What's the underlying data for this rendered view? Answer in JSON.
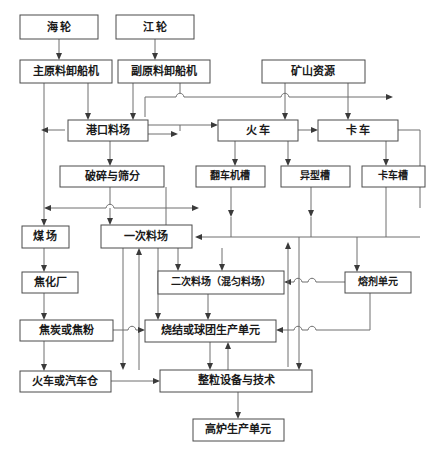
{
  "diagram": {
    "type": "flowchart",
    "canvas": {
      "width": 443,
      "height": 457
    },
    "style": {
      "box_fill": "#ffffff",
      "box_stroke": "#4a4a4a",
      "edge_stroke": "#6e6e6e",
      "arrow_fill": "#3a3a3a",
      "text_color": "#1a1a1a",
      "background": "#ffffff"
    },
    "nodes": [
      {
        "id": "n1",
        "label": "海  轮",
        "x": 20,
        "y": 15,
        "w": 78,
        "h": 24,
        "font": 11
      },
      {
        "id": "n2",
        "label": "江  轮",
        "x": 116,
        "y": 15,
        "w": 78,
        "h": 24,
        "font": 11
      },
      {
        "id": "n3",
        "label": "主原料卸船机",
        "x": 20,
        "y": 60,
        "w": 92,
        "h": 23,
        "font": 11
      },
      {
        "id": "n4",
        "label": "副原料卸船机",
        "x": 118,
        "y": 60,
        "w": 92,
        "h": 23,
        "font": 11
      },
      {
        "id": "n5",
        "label": "矿山资源",
        "x": 262,
        "y": 60,
        "w": 103,
        "h": 23,
        "font": 11
      },
      {
        "id": "n6",
        "label": "港口料场",
        "x": 68,
        "y": 120,
        "w": 80,
        "h": 21,
        "font": 11
      },
      {
        "id": "n7",
        "label": "火  车",
        "x": 218,
        "y": 120,
        "w": 80,
        "h": 21,
        "font": 11
      },
      {
        "id": "n8",
        "label": "卡  车",
        "x": 318,
        "y": 120,
        "w": 80,
        "h": 21,
        "font": 11
      },
      {
        "id": "n9",
        "label": "破碎与筛分",
        "x": 60,
        "y": 166,
        "w": 104,
        "h": 21,
        "font": 11
      },
      {
        "id": "n10",
        "label": "翻车机槽",
        "x": 196,
        "y": 166,
        "w": 69,
        "h": 21,
        "font": 10
      },
      {
        "id": "n11",
        "label": "异型槽",
        "x": 281,
        "y": 166,
        "w": 69,
        "h": 21,
        "font": 10
      },
      {
        "id": "n12",
        "label": "卡车槽",
        "x": 362,
        "y": 166,
        "w": 63,
        "h": 21,
        "font": 10
      },
      {
        "id": "n13",
        "label": "煤  场",
        "x": 22,
        "y": 226,
        "w": 47,
        "h": 22,
        "font": 11
      },
      {
        "id": "n14",
        "label": "一次料场",
        "x": 101,
        "y": 225,
        "w": 91,
        "h": 23,
        "font": 11
      },
      {
        "id": "n15",
        "label": "焦化厂",
        "x": 22,
        "y": 272,
        "w": 56,
        "h": 21,
        "font": 11
      },
      {
        "id": "n16",
        "label": "二次料场（混匀料场）",
        "x": 158,
        "y": 271,
        "w": 126,
        "h": 23,
        "font": 10
      },
      {
        "id": "n17",
        "label": "熔剂单元",
        "x": 345,
        "y": 272,
        "w": 66,
        "h": 21,
        "font": 10
      },
      {
        "id": "n18",
        "label": "焦炭或焦粉",
        "x": 20,
        "y": 320,
        "w": 93,
        "h": 21,
        "font": 11
      },
      {
        "id": "n19",
        "label": "烧结或球团生产单元",
        "x": 145,
        "y": 320,
        "w": 131,
        "h": 22,
        "font": 11
      },
      {
        "id": "n20",
        "label": "火车或汽车仓",
        "x": 20,
        "y": 371,
        "w": 91,
        "h": 21,
        "font": 11
      },
      {
        "id": "n21",
        "label": "整粒设备与技术",
        "x": 160,
        "y": 370,
        "w": 152,
        "h": 22,
        "font": 11
      },
      {
        "id": "n22",
        "label": "高炉生产单元",
        "x": 193,
        "y": 419,
        "w": 91,
        "h": 22,
        "font": 11
      }
    ],
    "edge_list": [
      "海轮 → 主原料卸船机",
      "江轮 → 副原料卸船机",
      "主原料卸船机 → 港口料场",
      "副原料卸船机 → 港口料场",
      "副原料卸船机 → 横向总线 → 火车 / 卡车",
      "矿山资源 → 火车",
      "矿山资源 → 卡车",
      "港口料场 → 破碎与筛分",
      "港口料场 → 火车",
      "火车 → 卡车",
      "火车 → 翻车机槽",
      "火车 → 异型槽",
      "卡车 → 卡车槽",
      "破碎与筛分 → 煤场",
      "破碎与筛分 → 一次料场",
      "翻车机槽 → 一次料场",
      "异型槽 → 一次料场",
      "卡车槽 → 一次料场",
      "煤场 → 焦化厂",
      "焦化厂 → 焦炭或焦粉",
      "一次料场 → 二次料场（混匀料场）",
      "一次料场 → 烧结或球团生产单元",
      "一次料场 → 整粒设备与技术",
      "二次料场（混匀料场） → 烧结或球团生产单元",
      "熔剂单元 → 二次料场（混匀料场）",
      "熔剂单元 → 烧结或球团生产单元",
      "焦炭或焦粉 → 烧结或球团生产单元",
      "焦炭或焦粉 → 火车或汽车仓",
      "火车或汽车仓 → 整粒设备与技术",
      "烧结或球团生产单元 → 整粒设备与技术",
      "整粒设备与技术 → 烧结或球团生产单元",
      "整粒设备与技术 → 高炉生产单元"
    ]
  }
}
